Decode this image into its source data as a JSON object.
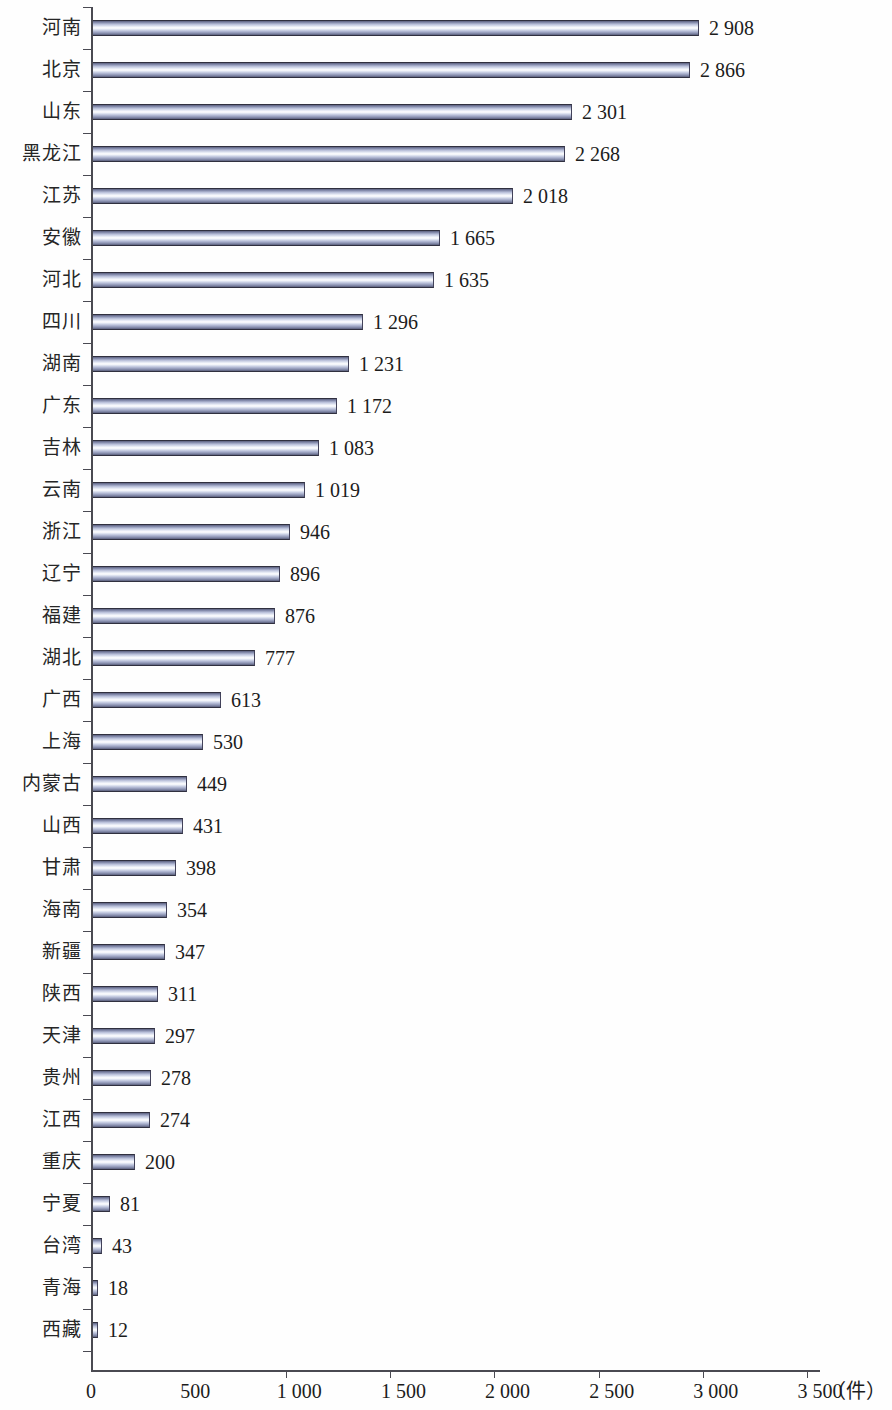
{
  "chart_data": {
    "type": "bar",
    "orientation": "horizontal",
    "title": "",
    "xlabel": "（件）",
    "ylabel": "",
    "xlim": [
      0,
      3500
    ],
    "grid": false,
    "legend": null,
    "unit": "（件）",
    "x_ticks": [
      "0",
      "500",
      "1 000",
      "1 500",
      "2 000",
      "2 500",
      "3 000",
      "3 500"
    ],
    "x_tick_values": [
      0,
      500,
      1000,
      1500,
      2000,
      2500,
      3000,
      3500
    ],
    "categories": [
      "河南",
      "北京",
      "山东",
      "黑龙江",
      "江苏",
      "安徽",
      "河北",
      "四川",
      "湖南",
      "广东",
      "吉林",
      "云南",
      "浙江",
      "辽宁",
      "福建",
      "湖北",
      "广西",
      "上海",
      "内蒙古",
      "山西",
      "甘肃",
      "海南",
      "新疆",
      "陕西",
      "天津",
      "贵州",
      "江西",
      "重庆",
      "宁夏",
      "台湾",
      "青海",
      "西藏"
    ],
    "values": [
      2908,
      2866,
      2301,
      2268,
      2018,
      1665,
      1635,
      1296,
      1231,
      1172,
      1083,
      1019,
      946,
      896,
      876,
      777,
      613,
      530,
      449,
      431,
      398,
      354,
      347,
      311,
      297,
      278,
      274,
      200,
      81,
      43,
      18,
      12
    ],
    "value_labels": [
      "2 908",
      "2 866",
      "2 301",
      "2 268",
      "2 018",
      "1 665",
      "1 635",
      "1 296",
      "1 231",
      "1 172",
      "1 083",
      "1 019",
      "946",
      "896",
      "876",
      "777",
      "613",
      "530",
      "449",
      "431",
      "398",
      "354",
      "347",
      "311",
      "297",
      "278",
      "274",
      "200",
      "81",
      "43",
      "18",
      "12"
    ],
    "colors": {
      "bar_light": "#ffffff",
      "bar_mid": "#b9c0da",
      "bar_dark": "#5b5f7d",
      "bar_edge": "#30303f",
      "axis": "#4a4a52",
      "text": "#1c1c1c",
      "background": "#ffffff"
    }
  }
}
